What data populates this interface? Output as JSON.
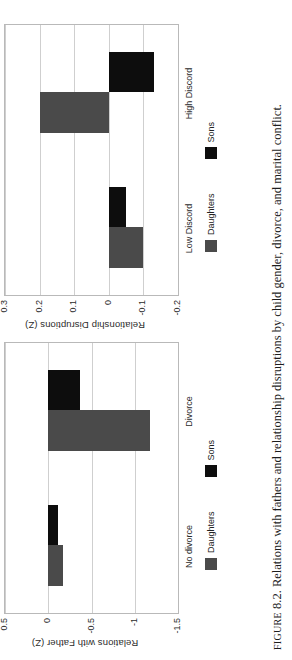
{
  "caption": {
    "label": "FIGURE",
    "number": "8.2.",
    "text": "Relations with fathers and relationship disruptions by child gender, divorce, and marital conflict."
  },
  "legend": {
    "daughters": "Daughters",
    "sons": "Sons"
  },
  "colors": {
    "daughters": "#4a4a4a",
    "sons": "#0d0d0d",
    "grid": "#cfcfcf",
    "frame": "#b9b9b9",
    "background": "#ffffff"
  },
  "chart_data": [
    {
      "type": "bar",
      "title": "",
      "xlabel": "",
      "ylabel": "Relations with Father (Z)",
      "categories": [
        "No divorce",
        "Divorce"
      ],
      "series": [
        {
          "name": "Daughters",
          "values": [
            -0.17,
            -1.18
          ]
        },
        {
          "name": "Sons",
          "values": [
            -0.11,
            -0.37
          ]
        }
      ],
      "yticks": [
        "0.5",
        "0",
        "-0.5",
        "-1",
        "-1.5"
      ],
      "ytickvalues": [
        0.5,
        0,
        -0.5,
        -1,
        -1.5
      ],
      "ylim": [
        -1.5,
        0.5
      ],
      "grid": true,
      "legend_position": "bottom"
    },
    {
      "type": "bar",
      "title": "",
      "xlabel": "",
      "ylabel": "Relationship Disruptions (Z)",
      "categories": [
        "Low Discord",
        "High Discord"
      ],
      "series": [
        {
          "name": "Daughters",
          "values": [
            -0.1,
            0.2
          ]
        },
        {
          "name": "Sons",
          "values": [
            -0.05,
            -0.13
          ]
        }
      ],
      "yticks": [
        "0.3",
        "0.2",
        "0.1",
        "0",
        "-0.1",
        "-0.2"
      ],
      "ytickvalues": [
        0.3,
        0.2,
        0.1,
        0,
        -0.1,
        -0.2
      ],
      "ylim": [
        -0.2,
        0.3
      ],
      "grid": true,
      "legend_position": "bottom"
    }
  ]
}
